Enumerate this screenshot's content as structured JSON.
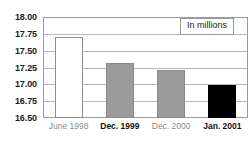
{
  "chart_data": {
    "type": "bar",
    "title": "",
    "subtitle": "",
    "xlabel": "",
    "ylabel": "",
    "categories": [
      "June 1998",
      "Dec. 1999",
      "Dec. 2000",
      "Jan. 2001"
    ],
    "values": [
      17.7,
      17.31,
      17.22,
      16.99
    ],
    "series": [
      {
        "name": "In millions",
        "values": [
          17.7,
          17.31,
          17.22,
          16.99
        ]
      }
    ],
    "ylim": [
      16.5,
      18.0
    ],
    "ytick_labels": [
      "18.00",
      "17.75",
      "17.50",
      "17.25",
      "17.00",
      "16.75",
      "16.50"
    ],
    "ytick_values": [
      18.0,
      17.75,
      17.5,
      17.25,
      17.0,
      16.75,
      16.5
    ],
    "grid": true,
    "legend": {
      "text": "In millions",
      "position": "top-right"
    },
    "bar_styles": [
      {
        "category": "June 1998",
        "fill": "white",
        "label_emphasis": "muted"
      },
      {
        "category": "Dec. 1999",
        "fill": "gray",
        "label_emphasis": "strong"
      },
      {
        "category": "Dec. 2000",
        "fill": "gray",
        "label_emphasis": "muted"
      },
      {
        "category": "Jan. 2001",
        "fill": "black",
        "label_emphasis": "strong"
      }
    ],
    "colors": {
      "bar_white": "#ffffff",
      "bar_gray": "#9b9b9b",
      "bar_black": "#000000",
      "grid": "#b9b9b9",
      "frame": "#9a9a9a",
      "label_muted": "#8d8d8d",
      "label_strong": "#111111",
      "background": "#ffffff"
    }
  }
}
